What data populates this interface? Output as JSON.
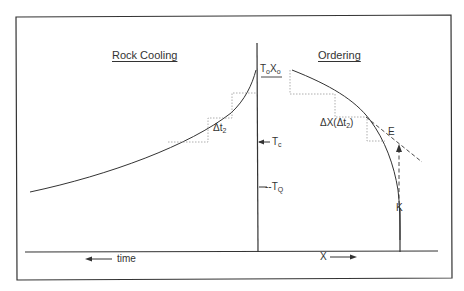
{
  "diagram": {
    "left_panel_title": "Rock Cooling",
    "right_panel_title": "Ordering",
    "labels": {
      "delta_t2": {
        "main": "Δt",
        "sub": "2"
      },
      "delta_x": {
        "main": "ΔX(Δt",
        "sub": "2",
        "tail": ")"
      },
      "t0": {
        "main": "T",
        "sub": "o"
      },
      "x0": {
        "main": "X",
        "sub": "o"
      },
      "tc": {
        "main": "T",
        "sub": "c"
      },
      "tq": {
        "prefix": "--T",
        "sub": "Q"
      },
      "e": "E",
      "k": "K"
    },
    "axes": {
      "left_axis_label": "time",
      "left_axis_arrow": "left",
      "right_axis_label": "X",
      "right_axis_arrow": "right"
    },
    "curves": [
      {
        "name": "rock-cooling-curve",
        "description": "temperature rising toward T0 at central axis"
      },
      {
        "name": "ordering-curve",
        "description": "order parameter X decreasing from X0 toward K"
      },
      {
        "name": "equilibrium-tangent",
        "style": "dashed",
        "label": "E"
      },
      {
        "name": "kinetic-arrow",
        "style": "dashed",
        "label": "K"
      }
    ],
    "colors": {
      "line": "#333333",
      "dotted": "#999999",
      "background": "#ffffff"
    }
  }
}
